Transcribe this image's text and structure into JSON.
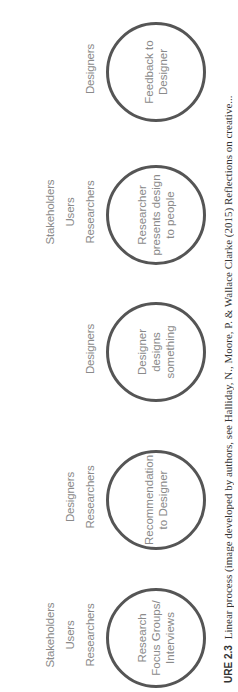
{
  "diagram": {
    "steps": [
      {
        "roles": [
          "Stakeholders",
          "Users",
          "Researchers"
        ],
        "circle": "Research Focus Groups/ Interviews"
      },
      {
        "roles": [
          "Designers",
          "Researchers"
        ],
        "circle": "Recommendation to Designer"
      },
      {
        "roles": [
          "Designers"
        ],
        "circle": "Designer designs something"
      },
      {
        "roles": [
          "Stakeholders",
          "Users",
          "Researchers"
        ],
        "circle": "Researcher presents design to people"
      },
      {
        "roles": [
          "Designers"
        ],
        "circle": "Feedback to Designer"
      }
    ],
    "caption": {
      "label": "URE 2.3",
      "text": "Linear process (image developed by authors, see Halliday, N., Moore, P. & Wallace Clarke (2015) Reflections on creative..."
    },
    "colors": {
      "circle_border": "#555555",
      "text": "#8a8a8a"
    }
  }
}
